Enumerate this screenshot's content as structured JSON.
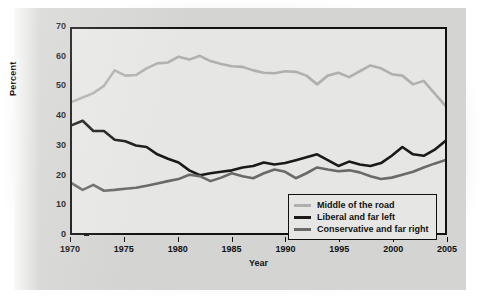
{
  "figure": {
    "background_color": "#d4d4d2",
    "plot_background_color": "#e6e6e4",
    "frame_color": "#111111"
  },
  "chart_data": {
    "type": "line",
    "title": "",
    "xlabel": "Year",
    "ylabel": "Percent",
    "xlim": [
      1970,
      2005
    ],
    "ylim": [
      0,
      70
    ],
    "xticks": [
      1970,
      1975,
      1980,
      1985,
      1990,
      1995,
      2000,
      2005
    ],
    "yticks": [
      0,
      10,
      20,
      30,
      40,
      50,
      60,
      70
    ],
    "grid": false,
    "legend_position": "lower right",
    "x": [
      1970,
      1971,
      1972,
      1973,
      1974,
      1975,
      1976,
      1977,
      1978,
      1979,
      1980,
      1981,
      1982,
      1983,
      1984,
      1985,
      1986,
      1987,
      1988,
      1989,
      1990,
      1991,
      1992,
      1993,
      1994,
      1995,
      1996,
      1997,
      1998,
      1999,
      2000,
      2001,
      2002,
      2003,
      2004,
      2005
    ],
    "series": [
      {
        "name": "Middle of the road",
        "color": "#b0b0ae",
        "values": [
          45.0,
          46.5,
          48.0,
          50.5,
          55.8,
          54.0,
          54.2,
          56.5,
          58.2,
          58.5,
          60.5,
          59.5,
          60.8,
          59.0,
          58.0,
          57.2,
          57.0,
          55.8,
          55.0,
          54.8,
          55.5,
          55.3,
          54.0,
          51.0,
          54.0,
          55.0,
          53.5,
          55.5,
          57.5,
          56.5,
          54.5,
          54.0,
          51.0,
          52.2,
          48.0,
          43.8
        ]
      },
      {
        "name": "Liberal and far left",
        "color": "#1a1a1a",
        "values": [
          37.0,
          38.5,
          35.0,
          35.0,
          32.0,
          31.5,
          30.0,
          29.5,
          27.0,
          25.5,
          24.2,
          21.5,
          19.8,
          20.5,
          21.0,
          21.5,
          22.5,
          23.0,
          24.2,
          23.5,
          24.0,
          25.0,
          26.0,
          27.0,
          25.0,
          23.0,
          24.5,
          23.5,
          23.0,
          24.0,
          26.5,
          29.5,
          27.0,
          26.5,
          28.5,
          31.5
        ]
      },
      {
        "name": "Conservative and far right",
        "color": "#6a6a68",
        "values": [
          17.0,
          14.8,
          16.5,
          14.5,
          14.8,
          15.2,
          15.5,
          16.2,
          17.0,
          17.8,
          18.5,
          20.0,
          19.5,
          17.8,
          19.0,
          20.5,
          19.5,
          18.8,
          20.5,
          21.8,
          21.0,
          18.8,
          20.5,
          22.5,
          21.8,
          21.2,
          21.5,
          20.8,
          19.5,
          18.5,
          19.0,
          20.0,
          21.0,
          22.5,
          23.8,
          25.0
        ]
      }
    ]
  }
}
